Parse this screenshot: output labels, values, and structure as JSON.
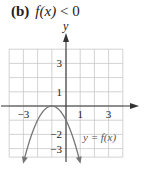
{
  "title": {
    "label": "(b)",
    "function": "f",
    "argument": "(x)",
    "relation": "< 0"
  },
  "axes": {
    "x_name": "",
    "y_name": "y"
  },
  "curve_label": "y = f(x)",
  "ticks": {
    "x": [
      {
        "value": -3,
        "text": "−3"
      },
      {
        "value": 1,
        "text": "1"
      },
      {
        "value": 3,
        "text": "3"
      }
    ],
    "y": [
      {
        "value": 3,
        "text": "3"
      },
      {
        "value": 1,
        "text": "1"
      },
      {
        "value": -2,
        "text": "−2"
      },
      {
        "value": -3,
        "text": "−3"
      }
    ]
  },
  "chart_data": {
    "type": "line",
    "xlabel": "",
    "ylabel": "y",
    "xlim": [
      -4,
      4
    ],
    "ylim": [
      -3.6,
      4
    ],
    "grid": true,
    "legend": "curve annotated 'y = f(x)' in lower right",
    "series": [
      {
        "name": "y = f(x)",
        "description": "downward parabola, vertex at (-1, 0), arrows at both ends",
        "x": [
          -3,
          -2.5,
          -2,
          -1.5,
          -1,
          -0.5,
          0,
          0.5,
          1
        ],
        "y": [
          -4,
          -2.25,
          -1,
          -0.25,
          0,
          -0.25,
          -1,
          -2.25,
          -4
        ]
      }
    ],
    "x_tick_labels": [
      "-3",
      "1",
      "3"
    ],
    "y_tick_labels": [
      "3",
      "1",
      "-2",
      "-3"
    ]
  }
}
